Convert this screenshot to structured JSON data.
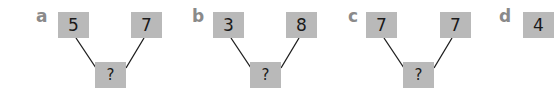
{
  "panels": [
    {
      "label": "a",
      "left": "5",
      "right": "7",
      "bottom": "?"
    },
    {
      "label": "b",
      "left": "3",
      "right": "8",
      "bottom": "?"
    },
    {
      "label": "c",
      "left": "7",
      "right": "7",
      "bottom": "?"
    },
    {
      "label": "d",
      "left": "4",
      "right": "",
      "bottom": ""
    }
  ],
  "colors": {
    "box": "#b9b9b9",
    "label": "#8a8a8a",
    "line": "#1a1a1a"
  }
}
